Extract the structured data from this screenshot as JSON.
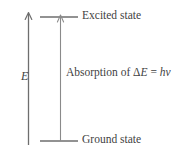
{
  "figure": {
    "type": "energy-level-diagram",
    "background_color": "#ffffff",
    "stroke_color": "#6e6e6e",
    "text_color": "#3f3f3f"
  },
  "axis": {
    "label": "E",
    "meaning": "energy",
    "direction": "upward-arrow"
  },
  "levels": {
    "excited": {
      "label": "Excited state",
      "y": 17
    },
    "ground": {
      "label": "Ground state",
      "y": 141
    }
  },
  "transition": {
    "direction": "upward",
    "prefix": "Absorption of ",
    "delta_symbol": "Δ",
    "energy_symbol": "E",
    "equals": " = ",
    "planck_symbol": "h",
    "frequency_symbol": "ν",
    "full_text": "Absorption of ΔE = hν"
  }
}
